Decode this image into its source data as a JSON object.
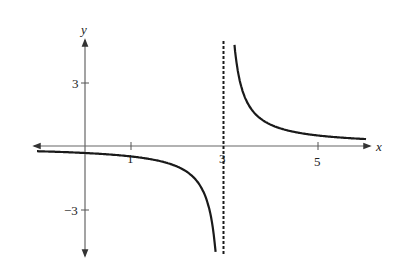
{
  "chart_data": {
    "type": "line",
    "title": "",
    "function": "y = 1/(x - 3)",
    "xlabel": "x",
    "ylabel": "y",
    "xlim": [
      -1.1,
      6.3
    ],
    "ylim": [
      -5,
      5
    ],
    "x_ticks": [
      {
        "value": 1,
        "label": "1"
      },
      {
        "value": 3,
        "label": "3"
      },
      {
        "value": 5,
        "label": "5"
      }
    ],
    "y_ticks": [
      {
        "value": 3,
        "label": "3"
      },
      {
        "value": -3,
        "label": "-3"
      }
    ],
    "asymptotes": [
      {
        "type": "vertical",
        "x": 3,
        "style": "dashed"
      },
      {
        "type": "horizontal",
        "y": 0
      }
    ],
    "series": [
      {
        "name": "left-branch",
        "x": [
          -1.0,
          0,
          1,
          2,
          2.5,
          2.8,
          2.9
        ],
        "y": [
          -0.25,
          -0.333,
          -0.5,
          -1.0,
          -2.0,
          -5.0,
          -5.0
        ]
      },
      {
        "name": "right-branch",
        "x": [
          3.2,
          3.5,
          4,
          5,
          6
        ],
        "y": [
          5.0,
          2.0,
          1.0,
          0.5,
          0.333
        ]
      }
    ],
    "grid": false,
    "legend": null
  },
  "axes": {
    "x_label": "x",
    "y_label": "y",
    "tick_1": "1",
    "tick_3": "3",
    "tick_5": "5",
    "tick_y3": "3",
    "tick_ym3": "−3"
  },
  "colors": {
    "axis": "#555555",
    "curve": "#1a1a1a",
    "asymptote": "#1a1a1a"
  }
}
